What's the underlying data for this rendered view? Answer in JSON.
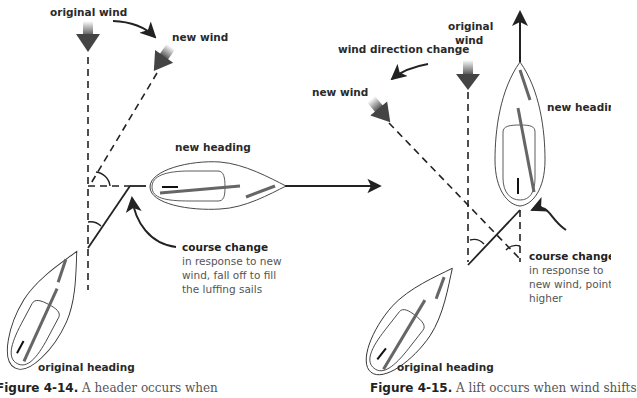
{
  "figure_left": {
    "labels": {
      "original_wind": "original wind",
      "new_wind": "new wind",
      "new_heading": "new heading",
      "original_heading": "original heading",
      "course_change_title": "course change",
      "course_change_line1": "in response to new",
      "course_change_line2": "wind, fall off to fill",
      "course_change_line3": "the luffing sails"
    },
    "caption": {
      "number": "Figure 4-14.",
      "text": "A header occurs when"
    }
  },
  "figure_right": {
    "labels": {
      "original_wind_line1": "original",
      "original_wind_line2": "wind",
      "wind_direction_change": "wind direction change",
      "new_wind": "new wind",
      "new_heading": "new heading",
      "original_heading": "original heading",
      "course_change_title": "course change",
      "course_change_line1": "in response to",
      "course_change_line2": "new wind, point",
      "course_change_line3": "higher"
    },
    "caption": {
      "number": "Figure 4-15.",
      "text": "A lift occurs when wind shifts"
    }
  },
  "colors": {
    "line": "#222222",
    "sail": "#666666",
    "hull": "#444444",
    "text_gray": "#555555"
  }
}
